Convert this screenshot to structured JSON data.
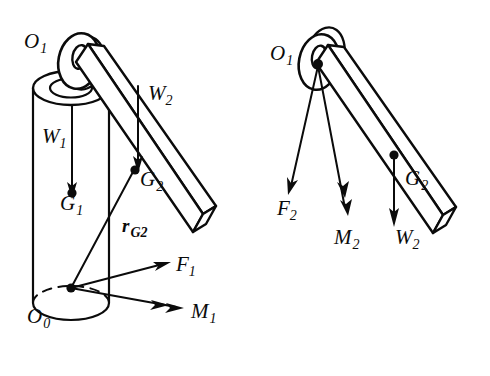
{
  "figure": {
    "ink_color": "#0b0b0b",
    "background_color": "#ffffff",
    "panels": [
      {
        "id": "left-panel",
        "name": "assembly-with-post",
        "description": "Vertical cylindrical post carrying a pivoting arm at O1, with base reactions at O0",
        "labels": [
          {
            "key": "O1",
            "base": "O",
            "sub": "1",
            "bold": false,
            "x": 24,
            "y": 48,
            "name": "label-o1"
          },
          {
            "key": "W1",
            "base": "W",
            "sub": "1",
            "bold": false,
            "x": 42,
            "y": 143,
            "name": "label-w1"
          },
          {
            "key": "G1",
            "base": "G",
            "sub": "1",
            "bold": false,
            "x": 60,
            "y": 210,
            "name": "label-g1"
          },
          {
            "key": "W2",
            "base": "W",
            "sub": "2",
            "bold": false,
            "x": 148,
            "y": 100,
            "name": "label-w2"
          },
          {
            "key": "G2",
            "base": "G",
            "sub": "2",
            "bold": false,
            "x": 140,
            "y": 186,
            "name": "label-g2"
          },
          {
            "key": "rG2",
            "base": "r",
            "sub": "G2",
            "bold": true,
            "x": 122,
            "y": 232,
            "name": "label-r-g2"
          },
          {
            "key": "O0",
            "base": "O",
            "sub": "0",
            "bold": false,
            "x": 27,
            "y": 323,
            "name": "label-o0"
          },
          {
            "key": "F1",
            "base": "F",
            "sub": "1",
            "bold": false,
            "x": 176,
            "y": 271,
            "name": "label-f1"
          },
          {
            "key": "M1",
            "base": "M",
            "sub": "1",
            "bold": false,
            "x": 191,
            "y": 318,
            "name": "label-m1"
          }
        ],
        "vectors": [
          {
            "name": "vector-w1",
            "label": "W1",
            "kind": "force",
            "heads": 1,
            "from": [
              72,
              105
            ],
            "to": [
              72,
              196
            ]
          },
          {
            "name": "vector-w2",
            "label": "W2",
            "kind": "force",
            "heads": 1,
            "from": [
              138,
              86
            ],
            "to": [
              138,
              170
            ]
          },
          {
            "name": "vector-f1",
            "label": "F1",
            "kind": "force",
            "heads": 1,
            "from": [
              71,
              288
            ],
            "to": [
              168,
              263
            ]
          },
          {
            "name": "vector-m1",
            "label": "M1",
            "kind": "moment",
            "heads": 2,
            "from": [
              71,
              288
            ],
            "to": [
              182,
              308
            ]
          },
          {
            "name": "vector-r-g2",
            "label": "rG2",
            "kind": "position",
            "heads": 0,
            "from": [
              71,
              288
            ],
            "to": [
              134,
              170
            ]
          }
        ],
        "points": [
          {
            "name": "point-g1",
            "label": "G1",
            "x": 72,
            "y": 193
          },
          {
            "name": "point-g2",
            "label": "G2",
            "x": 135,
            "y": 170
          },
          {
            "name": "point-o0",
            "label": "O0",
            "x": 71,
            "y": 288
          }
        ]
      },
      {
        "id": "right-panel",
        "name": "arm-free-body",
        "description": "Isolated arm free body about pivot O1 with reaction force F2, moment M2 and weight W2",
        "labels": [
          {
            "key": "O1",
            "base": "O",
            "sub": "1",
            "bold": false,
            "x": 270,
            "y": 60,
            "name": "label-o1"
          },
          {
            "key": "F2",
            "base": "F",
            "sub": "2",
            "bold": false,
            "x": 277,
            "y": 215,
            "name": "label-f2"
          },
          {
            "key": "M2",
            "base": "M",
            "sub": "2",
            "bold": false,
            "x": 334,
            "y": 244,
            "name": "label-m2"
          },
          {
            "key": "G2",
            "base": "G",
            "sub": "2",
            "bold": false,
            "x": 405,
            "y": 185,
            "name": "label-g2"
          },
          {
            "key": "W2",
            "base": "W",
            "sub": "2",
            "bold": false,
            "x": 395,
            "y": 244,
            "name": "label-w2"
          }
        ],
        "vectors": [
          {
            "name": "vector-f2",
            "label": "F2",
            "kind": "force",
            "heads": 1,
            "from": [
              318,
              66
            ],
            "to": [
              288,
              194
            ]
          },
          {
            "name": "vector-m2",
            "label": "M2",
            "kind": "moment",
            "heads": 2,
            "from": [
              318,
              66
            ],
            "to": [
              347,
              215
            ]
          },
          {
            "name": "vector-w2",
            "label": "W2",
            "kind": "force",
            "heads": 1,
            "from": [
              394,
              155
            ],
            "to": [
              394,
              226
            ]
          }
        ],
        "points": [
          {
            "name": "point-o1",
            "label": "O1",
            "x": 318,
            "y": 66
          },
          {
            "name": "point-g2",
            "label": "G2",
            "x": 394,
            "y": 155
          }
        ]
      }
    ]
  }
}
